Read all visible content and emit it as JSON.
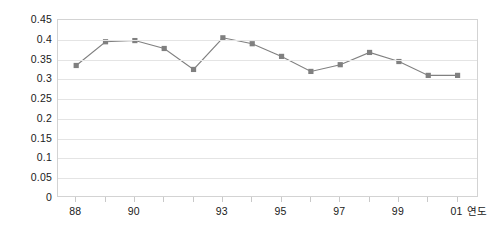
{
  "chart_data": {
    "type": "line",
    "title": "",
    "xlabel": "연도",
    "ylabel": "",
    "grid": true,
    "legend": false,
    "marker": "square",
    "series_color": "#808080",
    "grid_color": "#e4e4e4",
    "frame_color": "#d3d3d3",
    "ylim": [
      0,
      0.45
    ],
    "ytick_labels": [
      "0.45",
      "0.4",
      "0.35",
      "0.3",
      "0.25",
      "0.2",
      "0.15",
      "0.1",
      "0.05",
      "0"
    ],
    "ytick_values": [
      0.45,
      0.4,
      0.35,
      0.3,
      0.25,
      0.2,
      0.15,
      0.1,
      0.05,
      0
    ],
    "xtick_labels": [
      "88",
      "90",
      "93",
      "95",
      "97",
      "99",
      "01"
    ],
    "xtick_indices": [
      0,
      2,
      5,
      7,
      9,
      11,
      13
    ],
    "categories": [
      "88",
      "89",
      "90",
      "91",
      "93",
      "94",
      "95",
      "96",
      "97",
      "98",
      "99",
      "00",
      "01",
      "02"
    ],
    "x": [
      1988,
      1989,
      1990,
      1991,
      1992,
      1993,
      1994,
      1995,
      1996,
      1997,
      1998,
      1999,
      2000,
      2001
    ],
    "values": [
      0.335,
      0.395,
      0.398,
      0.378,
      0.325,
      0.405,
      0.39,
      0.358,
      0.32,
      0.337,
      0.368,
      0.345,
      0.31,
      0.31
    ]
  },
  "axis": {
    "x_title": "연도"
  }
}
